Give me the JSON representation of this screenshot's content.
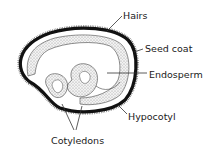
{
  "diagram": {
    "type": "seed cross-section",
    "labels": {
      "hairs": "Hairs",
      "seed_coat": "Seed coat",
      "endosperm": "Endosperm",
      "hypocotyl": "Hypocotyl",
      "cotyledons": "Cotyledons"
    },
    "colors": {
      "background": "#ffffff",
      "seed_coat": "#111111",
      "stipple": "#d8d8d8",
      "line": "#333333"
    }
  }
}
